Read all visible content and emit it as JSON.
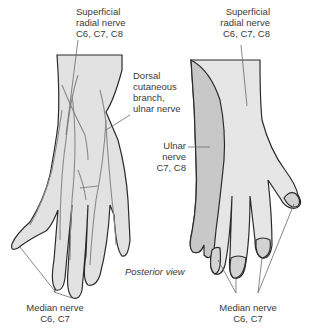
{
  "diagram": {
    "view_label": "Posterior view",
    "colors": {
      "radial_region": "#e6e6e6",
      "ulnar_region": "#c8c8c8",
      "median_region": "#d3d3d3",
      "outline": "#2b2b2b",
      "nerve": "#8a8a8a",
      "leader": "#6a6a6a"
    },
    "left_hand": {
      "labels": {
        "superficial_radial": {
          "line1": "Superficial",
          "line2": "radial nerve",
          "line3": "C6, C7, C8"
        },
        "dorsal_cutaneous": {
          "line1": "Dorsal",
          "line2": "cutaneous",
          "line3": "branch,",
          "line4": "ulnar nerve"
        },
        "median": {
          "line1": "Median nerve",
          "line2": "C6, C7"
        }
      }
    },
    "right_hand": {
      "labels": {
        "superficial_radial": {
          "line1": "Superficial",
          "line2": "radial nerve",
          "line3": "C6, C7, C8"
        },
        "ulnar": {
          "line1": "Ulnar",
          "line2": "nerve",
          "line3": "C7, C8"
        },
        "median": {
          "line1": "Median nerve",
          "line2": "C6, C7"
        }
      }
    }
  }
}
